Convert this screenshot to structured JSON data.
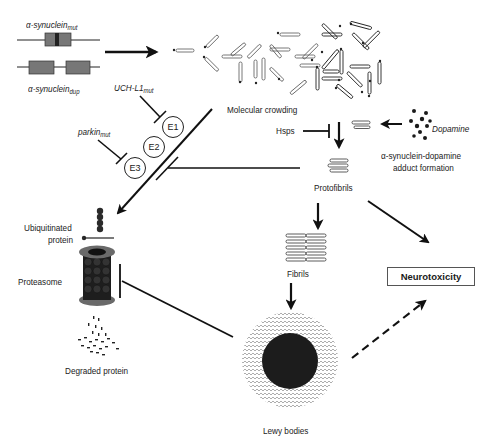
{
  "diagram": {
    "type": "pathway",
    "genes": {
      "mut_label_base": "α-synuclein",
      "mut_label_sub": "mut",
      "dup_label_base": "α-synuclein",
      "dup_label_sub": "dup"
    },
    "nodes": {
      "molecular_crowding": "Molecular crowding",
      "uchl1_base": "UCH-L1",
      "uchl1_sub": "mut",
      "parkin_base": "parkin",
      "parkin_sub": "mut",
      "enzymes": [
        "E1",
        "E2",
        "E3"
      ],
      "hsps": "Hsps",
      "dopamine": "Dopamine",
      "adduct_line1": "α-synuclein-dopamine",
      "adduct_line2": "adduct formation",
      "protofibrils": "Protofibrils",
      "fibrils": "Fibrils",
      "neurotoxicity": "Neurotoxicity",
      "ubiquitinated_line1": "Ubiquitinated",
      "ubiquitinated_line2": "protein",
      "proteasome": "Proteasome",
      "degraded_protein": "Degraded protein",
      "lewy_bodies": "Lewy bodies"
    },
    "edges": [
      {
        "from": "α-synuclein genes",
        "to": "Molecular crowding",
        "type": "activation"
      },
      {
        "from": "UCH-L1mut",
        "to": "E1",
        "type": "inhibition"
      },
      {
        "from": "parkinmut",
        "to": "E3",
        "type": "inhibition"
      },
      {
        "from": "E1/E2/E3 ubiquitination",
        "to": "Ubiquitinated protein",
        "type": "activation"
      },
      {
        "from": "Protofibrils",
        "to": "Ubiquitination pathway",
        "type": "inhibition"
      },
      {
        "from": "Hsps",
        "to": "Protofibril formation",
        "type": "inhibition"
      },
      {
        "from": "Dopamine",
        "to": "α-synuclein-dopamine adduct",
        "type": "activation"
      },
      {
        "from": "Molecular crowding",
        "to": "Protofibrils",
        "type": "activation"
      },
      {
        "from": "Protofibrils",
        "to": "Fibrils",
        "type": "activation"
      },
      {
        "from": "Protofibrils",
        "to": "Neurotoxicity",
        "type": "activation"
      },
      {
        "from": "Fibrils",
        "to": "Lewy bodies",
        "type": "activation"
      },
      {
        "from": "Lewy bodies",
        "to": "Proteasome",
        "type": "inhibition"
      },
      {
        "from": "Lewy bodies",
        "to": "Neurotoxicity",
        "type": "activation-dashed"
      }
    ],
    "colors": {
      "line": "#111111",
      "gene_box": "#777777",
      "gene_mutation": "#222222",
      "blob": "#1c1c1c",
      "proteasome_ring": "#6a6a6a"
    }
  }
}
